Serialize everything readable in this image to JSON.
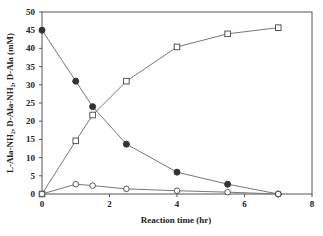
{
  "chart_data": {
    "type": "line",
    "title": "",
    "xlabel": "Reaction time (hr)",
    "ylabel": "L-Ala-NH₂, D-Ala-NH₂, D-Ala (mM)",
    "xlim": [
      0,
      8
    ],
    "ylim": [
      0,
      50
    ],
    "xticks": [
      0,
      2,
      4,
      6,
      8
    ],
    "yticks": [
      0,
      5,
      10,
      15,
      20,
      25,
      30,
      35,
      40,
      45,
      50
    ],
    "grid": false,
    "legend": "none",
    "series": [
      {
        "name": "L-Ala-NH2",
        "marker": "filled-circle",
        "x": [
          0,
          1,
          1.5,
          2.5,
          4,
          5.5,
          7
        ],
        "values": [
          45,
          31,
          24,
          13.7,
          6,
          2.7,
          0
        ]
      },
      {
        "name": "D-Ala",
        "marker": "open-square",
        "x": [
          0,
          1,
          1.5,
          2.5,
          4,
          5.5,
          7
        ],
        "values": [
          0,
          14.6,
          21.7,
          31,
          40.4,
          44,
          45.7
        ]
      },
      {
        "name": "D-Ala-NH2",
        "marker": "open-circle",
        "x": [
          0,
          1,
          1.5,
          2.5,
          4,
          5.5,
          7
        ],
        "values": [
          0,
          2.7,
          2.3,
          1.4,
          0.9,
          0.5,
          0
        ]
      }
    ]
  },
  "colors": {
    "line": "#777777",
    "marker_fill": "#333333",
    "axis": "#555555"
  }
}
